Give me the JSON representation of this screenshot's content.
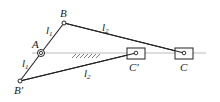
{
  "diagram": {
    "type": "slider-crank mechanism",
    "points": {
      "A": {
        "label": "A",
        "x": 41,
        "y": 53
      },
      "B": {
        "label": "B",
        "x": 64,
        "y": 23
      },
      "B_prime": {
        "label": "B′",
        "x": 20,
        "y": 81
      },
      "C": {
        "label": "C",
        "x": 184,
        "y": 53
      },
      "C_prime": {
        "label": "C′",
        "x": 136,
        "y": 53
      }
    },
    "links": {
      "l1_upper": {
        "label": "l",
        "sub": "1"
      },
      "l2_upper": {
        "label": "l",
        "sub": "2"
      },
      "l1_lower": {
        "label": "l",
        "sub": "1"
      },
      "l2_lower": {
        "label": "l",
        "sub": "2"
      }
    },
    "colors": {
      "line": "#222222",
      "guide": "#aaaaaa"
    }
  }
}
